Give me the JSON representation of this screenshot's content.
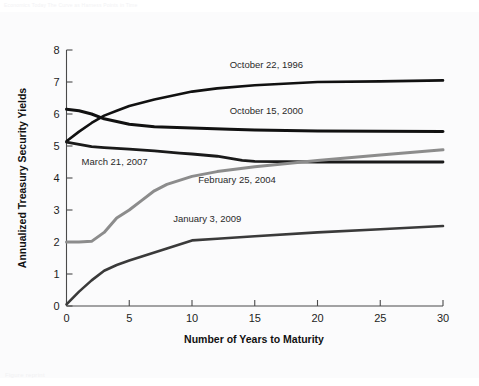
{
  "page": {
    "header_note": "Economics Today   The Curve as Harness Points in Time",
    "footer_note": "Figure  reprint"
  },
  "chart_data": {
    "type": "line",
    "title": "",
    "xlabel": "Number of Years to Maturity",
    "ylabel": "Annualized Treasury Security Yields",
    "xlim": [
      0,
      30
    ],
    "ylim": [
      0,
      8
    ],
    "xticks": [
      0,
      5,
      10,
      15,
      20,
      25,
      30
    ],
    "yticks": [
      0,
      1,
      2,
      3,
      4,
      5,
      6,
      7,
      8
    ],
    "xtick_labels": [
      "0",
      "5",
      "10",
      "15",
      "20",
      "25",
      "30"
    ],
    "ytick_labels": [
      "0",
      "1",
      "2",
      "3",
      "4",
      "5",
      "6",
      "7",
      "8"
    ],
    "grid": false,
    "legend_position": "inline-annotations",
    "series": [
      {
        "name": "October 22, 1996",
        "color": "#111111",
        "width": 2.6,
        "label_x": 13.0,
        "label_y": 7.45,
        "x": [
          0,
          1,
          2,
          3,
          4,
          5,
          7,
          10,
          12,
          15,
          20,
          25,
          30
        ],
        "values": [
          5.15,
          5.45,
          5.72,
          5.95,
          6.1,
          6.25,
          6.45,
          6.7,
          6.8,
          6.9,
          7.0,
          7.02,
          7.05
        ]
      },
      {
        "name": "October 15, 2000",
        "color": "#111111",
        "width": 3.0,
        "label_x": 13.0,
        "label_y": 6.0,
        "x": [
          0,
          1,
          2,
          3,
          5,
          7,
          10,
          13,
          15,
          20,
          25,
          30
        ],
        "values": [
          6.15,
          6.1,
          6.0,
          5.85,
          5.68,
          5.6,
          5.56,
          5.52,
          5.5,
          5.47,
          5.46,
          5.45
        ]
      },
      {
        "name": "March 21, 2007",
        "color": "#1a1a1a",
        "width": 2.8,
        "label_x": 1.2,
        "label_y": 4.42,
        "x": [
          0,
          1,
          2,
          3,
          5,
          7,
          9,
          10,
          12,
          14,
          15,
          20,
          25,
          30
        ],
        "values": [
          5.12,
          5.05,
          4.98,
          4.95,
          4.9,
          4.85,
          4.78,
          4.75,
          4.68,
          4.55,
          4.52,
          4.5,
          4.5,
          4.5
        ]
      },
      {
        "name": "February 25, 2004",
        "color": "#8c8c8c",
        "width": 3.0,
        "label_x": 10.5,
        "label_y": 3.85,
        "x": [
          0,
          1,
          2,
          3,
          4,
          5,
          6,
          7,
          8,
          10,
          12,
          15,
          20,
          25,
          30
        ],
        "values": [
          2.0,
          2.0,
          2.02,
          2.3,
          2.75,
          3.0,
          3.3,
          3.6,
          3.8,
          4.05,
          4.2,
          4.35,
          4.55,
          4.72,
          4.88
        ]
      },
      {
        "name": "January 3, 2009",
        "color": "#3a3a3a",
        "width": 2.6,
        "label_x": 8.5,
        "label_y": 2.62,
        "x": [
          0,
          1,
          2,
          3,
          4,
          5,
          6,
          8,
          10,
          12,
          15,
          20,
          25,
          30
        ],
        "values": [
          0.05,
          0.45,
          0.8,
          1.1,
          1.28,
          1.42,
          1.55,
          1.8,
          2.05,
          2.1,
          2.18,
          2.3,
          2.4,
          2.5
        ]
      }
    ]
  }
}
